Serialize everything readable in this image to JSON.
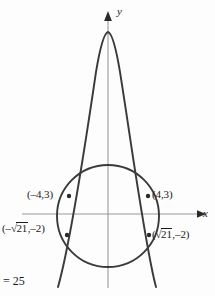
{
  "figure": {
    "kind": "math-graph",
    "background_color": "#fdfdfd",
    "curve_color": "#3a3a3a",
    "axis_color": "#8a8a8a",
    "label_color": "#1a1a1a",
    "axes": {
      "x_label": "x",
      "y_label": "y",
      "x_axis_y_px": 214,
      "y_axis_x_px": 108,
      "x_axis_from_px": 22,
      "x_axis_to_px": 198,
      "y_axis_from_px": 288,
      "y_axis_to_px": 14
    },
    "circle": {
      "center_px": [
        108,
        216
      ],
      "radius_px": 51,
      "radius_value": 5,
      "equation_tail": "= 25"
    },
    "parabola": {
      "vertex_px": [
        108,
        32
      ],
      "opens": "down",
      "left_end_px": [
        58,
        287
      ],
      "right_end_px": [
        156,
        287
      ]
    },
    "points": [
      {
        "name": "upper-left-intersection",
        "label": "(–4,3)",
        "coords": [
          -4,
          3
        ],
        "marker_px": [
          69,
          196
        ],
        "label_px": [
          27,
          189
        ]
      },
      {
        "name": "upper-right-intersection",
        "label": "(4,3)",
        "coords": [
          4,
          3
        ],
        "marker_px": [
          148,
          196
        ],
        "label_px": [
          152,
          189
        ]
      },
      {
        "name": "lower-left-intersection",
        "label_prefix": "(–",
        "label_radical_sign": "√",
        "label_radicand": "21",
        "label_suffix": ",–2)",
        "label_plain": "(–√21,–2)",
        "marker_px": [
          67,
          235
        ],
        "label_px": [
          2,
          222
        ]
      },
      {
        "name": "lower-right-intersection",
        "label_prefix": "(",
        "label_radical_sign": "√",
        "label_radicand": "21",
        "label_suffix": ",–2)",
        "label_plain": "(√21,–2)",
        "marker_px": [
          149,
          235
        ],
        "label_px": [
          152,
          228
        ]
      }
    ],
    "equation_fragment": "= 25"
  }
}
